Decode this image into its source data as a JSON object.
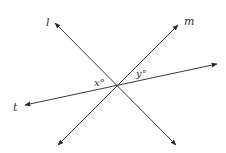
{
  "diagram": {
    "type": "intersecting-lines",
    "intersection": {
      "x": 117,
      "y": 85
    },
    "lines": [
      {
        "name": "l",
        "x1": 55,
        "y1": 23,
        "x2": 176,
        "y2": 145,
        "label": "l",
        "label_x": 46,
        "label_y": 26
      },
      {
        "name": "m",
        "x1": 58,
        "y1": 145,
        "x2": 178,
        "y2": 25,
        "label": "m",
        "label_x": 184,
        "label_y": 25
      },
      {
        "name": "t",
        "x1": 25,
        "y1": 105,
        "x2": 217,
        "y2": 64,
        "label": "t",
        "label_x": 13,
        "label_y": 111
      }
    ],
    "angles": [
      {
        "label": "x°",
        "x": 94,
        "y": 86
      },
      {
        "label": "y°",
        "x": 136,
        "y": 77
      }
    ],
    "colors": {
      "line": "#3a3a3a",
      "text": "#333333",
      "background": "#ffffff"
    }
  }
}
